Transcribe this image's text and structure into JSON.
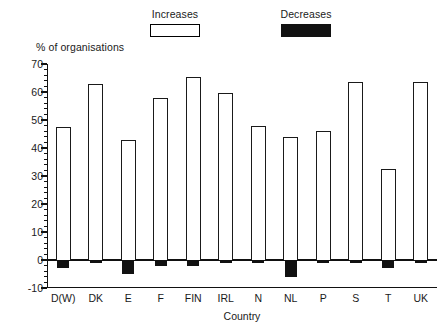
{
  "chart_data": {
    "type": "bar",
    "title": "",
    "subtitle": "",
    "xlabel": "Country",
    "ylabel": "% of organisations",
    "ylim": [
      -10,
      70
    ],
    "ytick_values": [
      70,
      60,
      50,
      40,
      30,
      20,
      10,
      0,
      -10
    ],
    "ytick_labels": [
      "70",
      "60",
      "50",
      "40",
      "30",
      "20",
      "10",
      "0",
      "-10"
    ],
    "minor_tick_interval": 2,
    "grid": false,
    "legend_position": "top",
    "categories": [
      "D(W)",
      "DK",
      "E",
      "F",
      "FIN",
      "IRL",
      "N",
      "NL",
      "P",
      "S",
      "T",
      "UK"
    ],
    "series": [
      {
        "name": "Increases",
        "color": "#ffffff",
        "edge_color": "#1a1a1a",
        "values": [
          47.5,
          63,
          43,
          58,
          65.5,
          59.5,
          48,
          44,
          46,
          63.5,
          32.5,
          63.5
        ]
      },
      {
        "name": "Decreases",
        "color": "#111111",
        "edge_color": "#111111",
        "values": [
          -3,
          -1,
          -5,
          -2,
          -2,
          -1,
          -1,
          -6,
          -1,
          -1,
          -3,
          -1
        ]
      }
    ],
    "annotations": []
  },
  "legend": {
    "entries": [
      {
        "label": "Increases",
        "swatch": "outlined-box-swatch"
      },
      {
        "label": "Decreases",
        "swatch": "filled-box-swatch"
      }
    ]
  },
  "colors": {
    "background": "#ffffff",
    "foreground": "#1a1a1a",
    "increases_fill": "#ffffff",
    "decreases_fill": "#111111",
    "axis": "#111111"
  }
}
